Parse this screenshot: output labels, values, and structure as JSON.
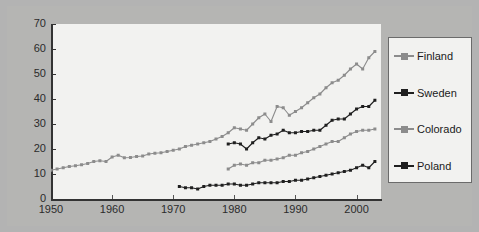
{
  "figure": {
    "background_color": "#b3b3b3",
    "panel_color": "#b5b5b3",
    "plot_background_color": "#f2f2f0",
    "axis_color": "#333333"
  },
  "legend": {
    "position": "right",
    "border_color": "#6b6b6b",
    "entries": [
      {
        "label": "Finland",
        "color": "#8c8c8c",
        "marker": "square"
      },
      {
        "label": "Sweden",
        "color": "#1f1f1f",
        "marker": "square"
      },
      {
        "label": "Colorado",
        "color": "#8c8c8c",
        "marker": "square"
      },
      {
        "label": "Poland",
        "color": "#1f1f1f",
        "marker": "square"
      }
    ]
  },
  "axes": {
    "y_ticks": [
      0,
      10,
      20,
      30,
      40,
      50,
      60,
      70
    ],
    "x_ticks": [
      1950,
      1960,
      1970,
      1980,
      1990,
      2000
    ]
  },
  "chart_data": {
    "type": "line",
    "title": "",
    "xlabel": "",
    "ylabel": "",
    "xlim": [
      1950,
      2004
    ],
    "ylim": [
      0,
      70
    ],
    "grid": false,
    "legend_position": "right",
    "series": [
      {
        "name": "Finland",
        "color": "#8c8c8c",
        "marker": "square",
        "x": [
          1950,
          1951,
          1952,
          1953,
          1954,
          1955,
          1956,
          1957,
          1958,
          1959,
          1960,
          1961,
          1962,
          1963,
          1964,
          1965,
          1966,
          1967,
          1968,
          1969,
          1970,
          1971,
          1972,
          1973,
          1974,
          1975,
          1976,
          1977,
          1978,
          1979,
          1980,
          1981,
          1982,
          1983,
          1984,
          1985,
          1986,
          1987,
          1988,
          1989,
          1990,
          1991,
          1992,
          1993,
          1994,
          1995,
          1996,
          1997,
          1998,
          1999,
          2000,
          2001,
          2002,
          2003
        ],
        "values": [
          11.5,
          12.0,
          12.5,
          13.0,
          13.3,
          13.7,
          14.2,
          15.0,
          15.3,
          15.0,
          16.8,
          17.5,
          16.5,
          16.6,
          17.0,
          17.2,
          18.0,
          18.3,
          18.5,
          19.0,
          19.5,
          20.0,
          21.0,
          21.5,
          22.0,
          22.5,
          23.0,
          24.0,
          25.0,
          26.5,
          28.5,
          28.0,
          27.5,
          30.0,
          32.5,
          34.0,
          31.0,
          37.0,
          36.5,
          33.5,
          35.0,
          36.5,
          38.5,
          40.5,
          42.0,
          44.5,
          46.5,
          47.5,
          49.5,
          52.0,
          54.0,
          52.0,
          56.5,
          59.0
        ]
      },
      {
        "name": "Sweden",
        "color": "#1f1f1f",
        "marker": "square",
        "x": [
          1979,
          1980,
          1981,
          1982,
          1983,
          1984,
          1985,
          1986,
          1987,
          1988,
          1989,
          1990,
          1991,
          1992,
          1993,
          1994,
          1995,
          1996,
          1997,
          1998,
          1999,
          2000,
          2001,
          2002,
          2003
        ],
        "values": [
          22.0,
          22.5,
          22.0,
          20.0,
          22.5,
          24.5,
          24.0,
          25.5,
          26.0,
          27.5,
          26.5,
          26.5,
          27.0,
          27.0,
          27.5,
          27.5,
          29.5,
          31.5,
          32.0,
          32.0,
          34.0,
          36.0,
          37.0,
          37.0,
          39.5
        ]
      },
      {
        "name": "Colorado",
        "color": "#8c8c8c",
        "marker": "square",
        "x": [
          1979,
          1980,
          1981,
          1982,
          1983,
          1984,
          1985,
          1986,
          1987,
          1988,
          1989,
          1990,
          1991,
          1992,
          1993,
          1994,
          1995,
          1996,
          1997,
          1998,
          1999,
          2000,
          2001,
          2002,
          2003
        ],
        "values": [
          12.0,
          13.5,
          14.0,
          13.5,
          14.5,
          14.5,
          15.5,
          15.5,
          16.0,
          16.5,
          17.5,
          17.5,
          18.5,
          19.0,
          20.0,
          21.0,
          22.0,
          23.0,
          23.0,
          24.5,
          26.0,
          27.0,
          27.5,
          27.5,
          28.0
        ]
      },
      {
        "name": "Poland",
        "color": "#1f1f1f",
        "marker": "square",
        "x": [
          1971,
          1972,
          1973,
          1974,
          1975,
          1976,
          1977,
          1978,
          1979,
          1980,
          1981,
          1982,
          1983,
          1984,
          1985,
          1986,
          1987,
          1988,
          1989,
          1990,
          1991,
          1992,
          1993,
          1994,
          1995,
          1996,
          1997,
          1998,
          1999,
          2000,
          2001,
          2002,
          2003
        ],
        "values": [
          5.0,
          4.5,
          4.5,
          4.0,
          5.0,
          5.5,
          5.5,
          5.5,
          6.0,
          6.0,
          5.5,
          5.5,
          6.0,
          6.5,
          6.5,
          6.5,
          6.5,
          7.0,
          7.0,
          7.5,
          7.5,
          8.0,
          8.5,
          9.0,
          9.5,
          10.0,
          10.5,
          11.0,
          11.5,
          12.5,
          13.5,
          12.5,
          15.0
        ]
      }
    ]
  }
}
